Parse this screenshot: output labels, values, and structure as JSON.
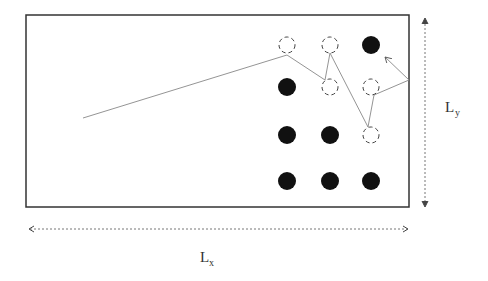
{
  "diagram": {
    "box": {
      "x": 26,
      "y": 15,
      "w": 383,
      "h": 192
    },
    "labels": {
      "lx_main": "L",
      "lx_sub": "x",
      "ly_main": "L",
      "ly_sub": "y"
    },
    "filled_sites": [
      {
        "x": 371,
        "y": 45
      },
      {
        "x": 287,
        "y": 87
      },
      {
        "x": 287,
        "y": 135
      },
      {
        "x": 330,
        "y": 135
      },
      {
        "x": 287,
        "y": 181
      },
      {
        "x": 330,
        "y": 181
      },
      {
        "x": 371,
        "y": 181
      }
    ],
    "empty_sites": [
      {
        "x": 287,
        "y": 45
      },
      {
        "x": 330,
        "y": 45
      },
      {
        "x": 330,
        "y": 87
      },
      {
        "x": 371,
        "y": 87
      },
      {
        "x": 371,
        "y": 135
      }
    ],
    "path_points": [
      [
        83,
        118
      ],
      [
        287,
        55
      ],
      [
        325,
        80
      ],
      [
        330,
        53
      ],
      [
        368,
        127
      ],
      [
        374,
        95
      ],
      [
        409,
        80
      ],
      [
        385,
        57
      ]
    ]
  }
}
